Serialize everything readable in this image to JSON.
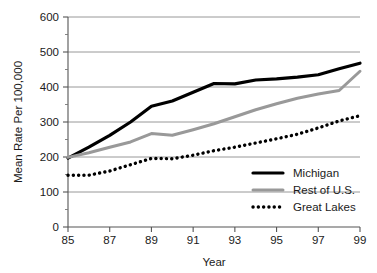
{
  "chart_data": {
    "type": "line",
    "title": "",
    "xlabel": "Year",
    "ylabel": "Mean Rate Per 100,000",
    "xlim": [
      85,
      99
    ],
    "ylim": [
      0,
      600
    ],
    "grid": true,
    "grid_axis": "y",
    "legend_position": "bottom-right",
    "x": [
      85,
      86,
      87,
      88,
      89,
      90,
      91,
      92,
      93,
      94,
      95,
      96,
      97,
      98,
      99
    ],
    "xtick_labels": [
      "85",
      "87",
      "89",
      "91",
      "93",
      "95",
      "97",
      "99"
    ],
    "xtick_values": [
      85,
      87,
      89,
      91,
      93,
      95,
      97,
      99
    ],
    "ytick_labels": [
      "0",
      "100",
      "200",
      "300",
      "400",
      "500",
      "600"
    ],
    "ytick_values": [
      0,
      100,
      200,
      300,
      400,
      500,
      600
    ],
    "series": [
      {
        "name": "Michigan",
        "color": "#000000",
        "style": "solid",
        "width": 3.2,
        "values": [
          197,
          228,
          262,
          300,
          345,
          360,
          385,
          410,
          409,
          420,
          423,
          428,
          435,
          452,
          468
        ]
      },
      {
        "name": "Rest of U.S.",
        "color": "#999999",
        "style": "solid",
        "width": 3.0,
        "values": [
          199,
          212,
          228,
          243,
          267,
          262,
          278,
          295,
          315,
          335,
          352,
          368,
          380,
          390,
          445
        ]
      },
      {
        "name": "Great Lakes",
        "color": "#000000",
        "style": "dotted",
        "width": 3.4,
        "values": [
          148,
          148,
          160,
          178,
          196,
          195,
          205,
          218,
          228,
          240,
          252,
          265,
          283,
          303,
          318
        ]
      }
    ]
  },
  "legend": {
    "items": [
      {
        "label": "Michigan",
        "swatch": "thick-black-solid"
      },
      {
        "label": "Rest of U.S.",
        "swatch": "gray-solid"
      },
      {
        "label": "Great Lakes",
        "swatch": "black-dotted"
      }
    ]
  },
  "axes": {
    "y_title": "Mean Rate Per 100,000",
    "x_title": "Year"
  }
}
